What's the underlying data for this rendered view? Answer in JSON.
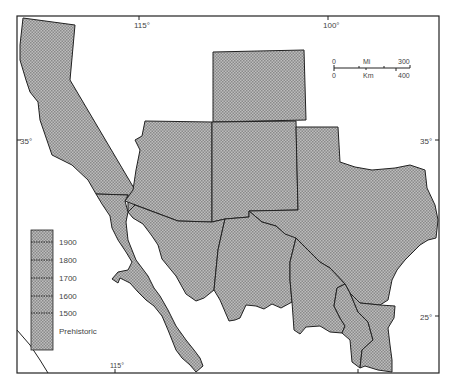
{
  "map": {
    "graticule": {
      "top_labels": [
        "115°",
        "100°"
      ],
      "bottom_labels": [
        "115°"
      ],
      "left_labels": [
        "35°"
      ],
      "right_labels": [
        "35°",
        "25°"
      ]
    },
    "scale_bar": {
      "miles_unit": "Mi",
      "miles_start": "0",
      "miles_end": "300",
      "km_unit": "Km",
      "km_start": "0",
      "km_end": "400"
    },
    "legend": {
      "entries": [
        "1900",
        "1800",
        "1700",
        "1600",
        "1500",
        "Prehistoric"
      ]
    },
    "regions": [
      "California",
      "Arizona",
      "Colorado",
      "New Mexico",
      "Texas",
      "Baja California",
      "Sonora",
      "Chihuahua",
      "Coahuila",
      "Nuevo León",
      "Tamaulipas"
    ],
    "colors": {
      "fill": "#a8a8a8",
      "stroke": "#222222",
      "background": "#ffffff"
    }
  }
}
